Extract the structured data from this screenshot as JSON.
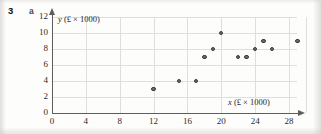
{
  "exercise": {
    "number": "3",
    "part": "a"
  },
  "chart_data": {
    "type": "scatter",
    "title": "",
    "xlabel": "x (£ × 1000)",
    "ylabel": "y (£ × 1000)",
    "xlabel_var": "x",
    "xlabel_units": "(£ × 1000)",
    "ylabel_var": "y",
    "ylabel_units": "(£ × 1000)",
    "xlim": [
      0,
      28
    ],
    "ylim": [
      0,
      12
    ],
    "xticks": [
      0,
      4,
      8,
      12,
      16,
      20,
      24,
      28
    ],
    "yticks": [
      0,
      2,
      4,
      6,
      8,
      10,
      12
    ],
    "grid": true,
    "legend": "none",
    "marker_color": "#6b6b72",
    "marker_edge_color": "#3a3a42",
    "axis_color": "#5d5d5d",
    "grid_color": "#dededa",
    "points": [
      {
        "x": 12,
        "y": 3
      },
      {
        "x": 15,
        "y": 4
      },
      {
        "x": 17,
        "y": 4
      },
      {
        "x": 18,
        "y": 7
      },
      {
        "x": 19,
        "y": 8
      },
      {
        "x": 20,
        "y": 10
      },
      {
        "x": 22,
        "y": 7
      },
      {
        "x": 23,
        "y": 7
      },
      {
        "x": 24,
        "y": 8
      },
      {
        "x": 25,
        "y": 9
      },
      {
        "x": 26,
        "y": 8
      },
      {
        "x": 29,
        "y": 9
      }
    ]
  }
}
